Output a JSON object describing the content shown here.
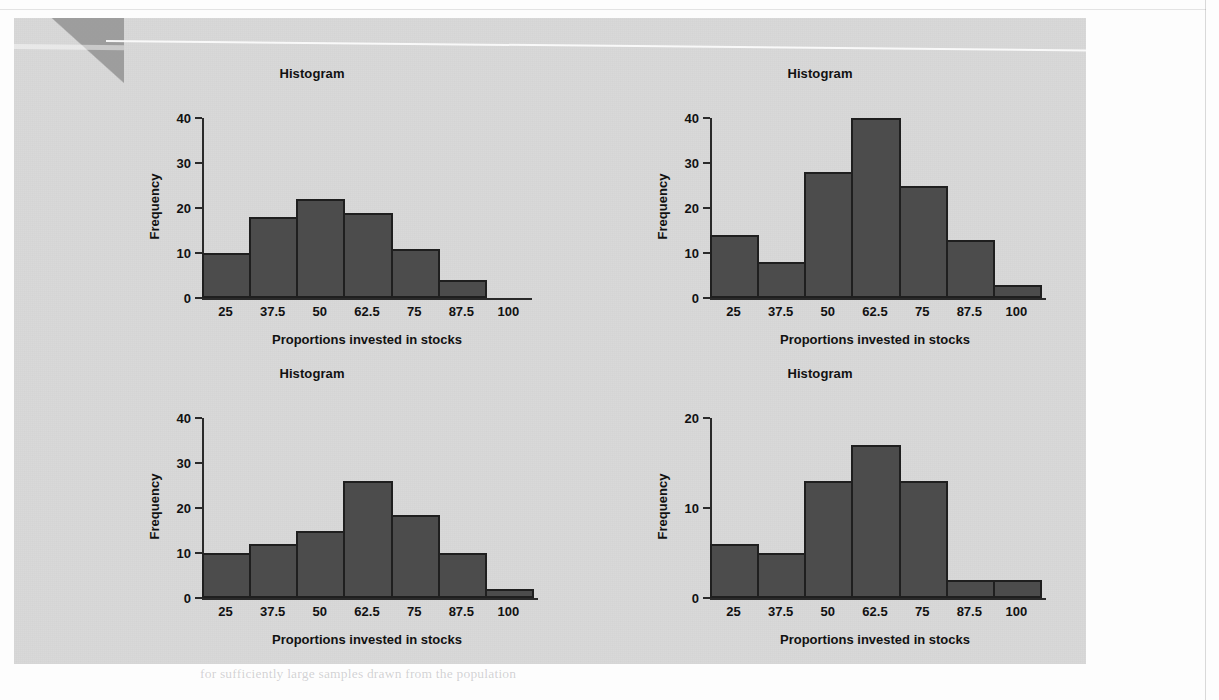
{
  "figure": {
    "background_color": "#d9d9d9",
    "bar_fill_color": "#4c4c4c",
    "bar_edge_color": "#1f1f1f",
    "axis_color": "#2a2a2a"
  },
  "charts": [
    {
      "id": "histogram-top-left",
      "chart_data": {
        "type": "bar",
        "title": "Histogram",
        "xlabel": "Proportions invested in stocks",
        "ylabel": "Frequency",
        "categories": [
          "25",
          "37.5",
          "50",
          "62.5",
          "75",
          "87.5",
          "100"
        ],
        "values": [
          10,
          18,
          22,
          19,
          11,
          4,
          0
        ],
        "yticks": [
          "0",
          "10",
          "20",
          "30",
          "40"
        ],
        "ytick_values": [
          0,
          10,
          20,
          30,
          40
        ],
        "ylim": [
          0,
          40
        ],
        "grid": false,
        "legend": "none"
      }
    },
    {
      "id": "histogram-top-right",
      "chart_data": {
        "type": "bar",
        "title": "Histogram",
        "xlabel": "Proportions invested in stocks",
        "ylabel": "Frequency",
        "categories": [
          "25",
          "37.5",
          "50",
          "62.5",
          "75",
          "87.5",
          "100"
        ],
        "values": [
          14,
          8,
          28,
          40,
          25,
          13,
          3
        ],
        "yticks": [
          "0",
          "10",
          "20",
          "30",
          "40"
        ],
        "ytick_values": [
          0,
          10,
          20,
          30,
          40
        ],
        "ylim": [
          0,
          40
        ],
        "grid": false,
        "legend": "none"
      }
    },
    {
      "id": "histogram-bottom-left",
      "chart_data": {
        "type": "bar",
        "title": "Histogram",
        "xlabel": "Proportions invested in stocks",
        "ylabel": "Frequency",
        "categories": [
          "25",
          "37.5",
          "50",
          "62.5",
          "75",
          "87.5",
          "100"
        ],
        "values": [
          10,
          12,
          15,
          26,
          18.5,
          10,
          2
        ],
        "yticks": [
          "0",
          "10",
          "20",
          "30",
          "40"
        ],
        "ytick_values": [
          0,
          10,
          20,
          30,
          40
        ],
        "ylim": [
          0,
          40
        ],
        "grid": false,
        "legend": "none"
      }
    },
    {
      "id": "histogram-bottom-right",
      "chart_data": {
        "type": "bar",
        "title": "Histogram",
        "xlabel": "Proportions invested in stocks",
        "ylabel": "Frequency",
        "categories": [
          "25",
          "37.5",
          "50",
          "62.5",
          "75",
          "87.5",
          "100"
        ],
        "values": [
          6,
          5,
          13,
          17,
          13,
          2,
          2
        ],
        "yticks": [
          "0",
          "10",
          "20"
        ],
        "ytick_values": [
          0,
          10,
          20
        ],
        "ylim": [
          0,
          20
        ],
        "grid": false,
        "legend": "none"
      }
    }
  ],
  "bleed_through_lines": [
    {
      "x": 200,
      "y": 30,
      "text": "of the investment portfolio",
      "bold": false
    },
    {
      "x": 420,
      "y": 60,
      "text": "that a share could be described as a while these rules would be met in",
      "bold": false
    },
    {
      "x": 420,
      "y": 82,
      "text": "the 4 percent and might lower the distributed and as such",
      "bold": false
    },
    {
      "x": 420,
      "y": 104,
      "text": "describing the  normal  curve  the  two  common  levels  are  given",
      "bold": false
    },
    {
      "x": 420,
      "y": 126,
      "text": "the value and in this case",
      "bold": false
    },
    {
      "x": 420,
      "y": 176,
      "text": "describing a statistic in the distribution  under  consideration",
      "bold": false
    },
    {
      "x": 420,
      "y": 198,
      "text": "mean of the sampling distribution of",
      "bold": false
    },
    {
      "x": 420,
      "y": 330,
      "text": "THE  WIDTH  OF  DISTRIBUTIONS",
      "bold": true
    },
    {
      "x": 420,
      "y": 360,
      "text": "and  the  value  of  the  expected  value",
      "bold": true
    },
    {
      "x": 420,
      "y": 430,
      "text": "In this section we consider the width of the sampling distribution",
      "bold": false
    },
    {
      "x": 420,
      "y": 452,
      "text": "of a proportion. The standard error of the proportion is given by",
      "bold": false
    },
    {
      "x": 420,
      "y": 474,
      "text": "the formula and the distribution approaches normality as the",
      "bold": false
    },
    {
      "x": 420,
      "y": 496,
      "text": "sample size increases so the calculation becomes simpler for",
      "bold": false
    },
    {
      "x": 420,
      "y": 518,
      "text": "larger samples of the population being measured here",
      "bold": false
    },
    {
      "x": 200,
      "y": 600,
      "text": "the sampling distribution of the sample proportion",
      "bold": false
    },
    {
      "x": 200,
      "y": 622,
      "text": "becomes narrower as the sample size increases and the",
      "bold": false
    },
    {
      "x": 200,
      "y": 644,
      "text": "shape approaches that of the normal distribution curve",
      "bold": false
    },
    {
      "x": 200,
      "y": 666,
      "text": "for sufficiently large samples drawn from the population",
      "bold": false
    }
  ]
}
